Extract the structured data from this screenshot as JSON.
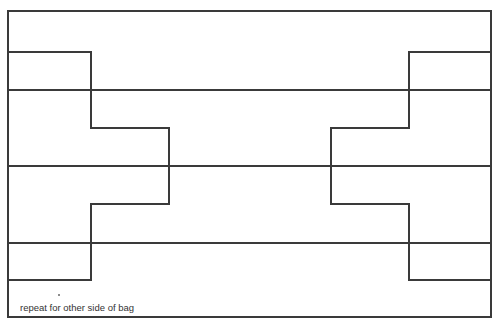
{
  "diagram": {
    "type": "sewing-pattern",
    "note": "repeat for other side of bag",
    "line_color": "#3a3a3a"
  }
}
